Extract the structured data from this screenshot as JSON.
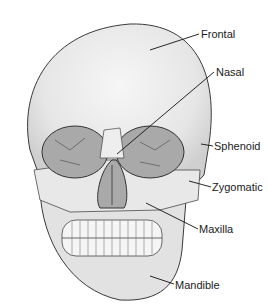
{
  "figure": {
    "colors": {
      "bone": "#e4e4e4",
      "bone_highlight": "#f4f4f4",
      "bone_shadow": "#c8c8c8",
      "cavity": "#a9a9a9",
      "outline": "#3a3a3a",
      "leader_line": "#111111",
      "label_text": "#1a1a1a"
    }
  },
  "labels": [
    {
      "id": "frontal",
      "text": "Frontal",
      "x": 201,
      "y": 28,
      "line": [
        150,
        50,
        199,
        34
      ]
    },
    {
      "id": "nasal",
      "text": "Nasal",
      "x": 216,
      "y": 66,
      "line": [
        117,
        154,
        214,
        72
      ]
    },
    {
      "id": "sphenoid",
      "text": "Sphenoid",
      "x": 214,
      "y": 140,
      "line": [
        201,
        144,
        213,
        146
      ]
    },
    {
      "id": "zygomatic",
      "text": "Zygomatic",
      "x": 212,
      "y": 181,
      "line": [
        189,
        181,
        211,
        187
      ]
    },
    {
      "id": "maxilla",
      "text": "Maxilla",
      "x": 199,
      "y": 223,
      "line": [
        146,
        203,
        198,
        229
      ]
    },
    {
      "id": "mandible",
      "text": "Mandible",
      "x": 175,
      "y": 279,
      "line": [
        150,
        276,
        174,
        284
      ]
    }
  ]
}
